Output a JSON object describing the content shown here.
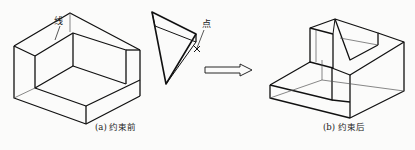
{
  "figure": {
    "panel_a": {
      "caption": "(a) 约束前",
      "label_line": "线",
      "label_point": "点"
    },
    "panel_b": {
      "caption": "(b) 约束后"
    },
    "arrow_icon": "hollow-right-arrow",
    "colors": {
      "stroke": "#111111",
      "thin_stroke": "#555555",
      "background": "#fbfbfa"
    }
  }
}
